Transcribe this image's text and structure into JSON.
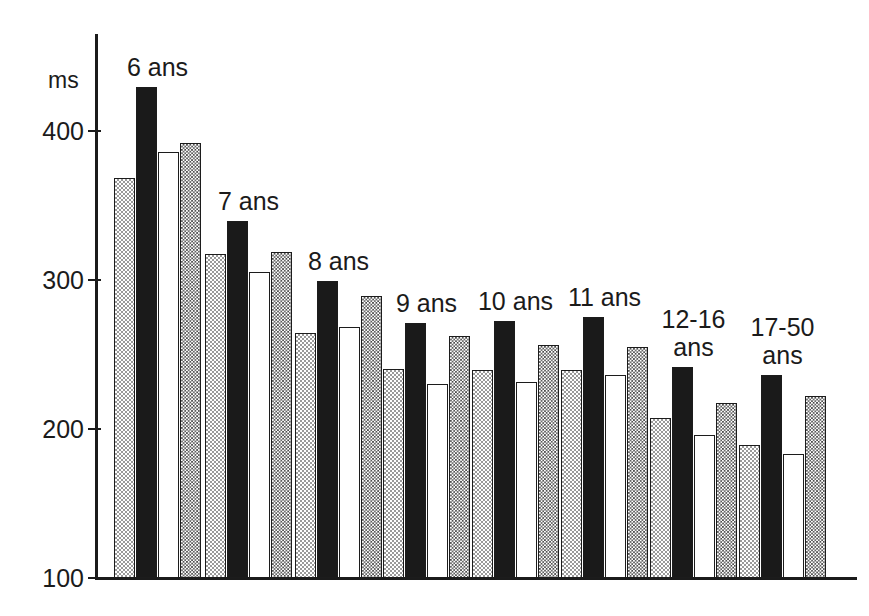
{
  "chart": {
    "type": "bar",
    "title": "",
    "unit_label": "ms",
    "ylabel": "ms",
    "xlabel": ""
  },
  "axis": {
    "y_ticks": [
      "400",
      "300",
      "200",
      "100"
    ],
    "y_tick_values": [
      400,
      300,
      200,
      100
    ],
    "ylim": [
      100,
      450
    ],
    "grid": "off"
  },
  "chart_data": {
    "type": "bar",
    "title": "",
    "xlabel": "",
    "ylabel": "ms",
    "ylim": [
      100,
      450
    ],
    "yticks": [
      100,
      200,
      300,
      400
    ],
    "grid": false,
    "legend": "none",
    "categories": [
      "6 ans",
      "7 ans",
      "8 ans",
      "9 ans",
      "10 ans",
      "11 ans",
      "12-16 ans",
      "17-50 ans"
    ],
    "series": [
      {
        "name": "serie-1",
        "pattern": "light-checker",
        "values": [
          368,
          317,
          264,
          240,
          239,
          239,
          207,
          189
        ]
      },
      {
        "name": "serie-2",
        "pattern": "solid-black",
        "values": [
          429,
          339,
          299,
          271,
          272,
          275,
          241,
          236
        ]
      },
      {
        "name": "serie-3",
        "pattern": "white",
        "values": [
          385,
          305,
          268,
          230,
          231,
          236,
          196,
          183
        ]
      },
      {
        "name": "serie-4",
        "pattern": "dark-checker",
        "values": [
          391,
          318,
          289,
          262,
          256,
          255,
          217,
          222
        ]
      }
    ]
  },
  "groups": [
    {
      "label": "6 ans",
      "label_lines": "6 ans"
    },
    {
      "label": "7 ans",
      "label_lines": "7 ans"
    },
    {
      "label": "8 ans",
      "label_lines": "8 ans"
    },
    {
      "label": "9 ans",
      "label_lines": "9 ans"
    },
    {
      "label": "10 ans",
      "label_lines": "10 ans"
    },
    {
      "label": "11 ans",
      "label_lines": "11 ans"
    },
    {
      "label": "12-16 ans",
      "label_lines": "12-16\nans"
    },
    {
      "label": "17-50 ans",
      "label_lines": "17-50\nans"
    }
  ],
  "colors": {
    "axis": "#1b1b1b",
    "bar_outline": "#1c1c1c",
    "light_checker": "#9a9a9a",
    "solid_black": "#1a1a1a",
    "white": "#ffffff",
    "dark_checker": "#4a4a4a",
    "background": "#ffffff"
  }
}
